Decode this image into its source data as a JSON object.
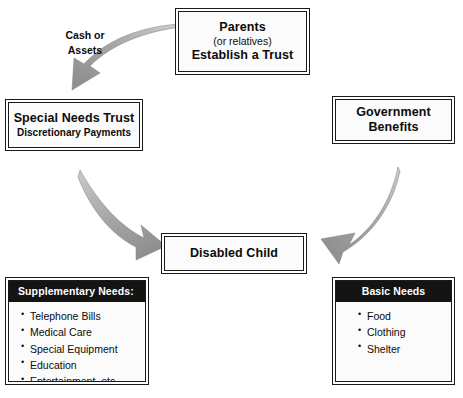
{
  "diagram": {
    "colors": {
      "box_border": "#1a1a1a",
      "box_fill": "#fbfbfb",
      "panel_header_bg": "#141414",
      "panel_header_text": "#ffffff",
      "arrow_light": "#c9c9c9",
      "arrow_dark": "#8f8f8f",
      "text": "#0c0c0c",
      "background": "#ffffff"
    },
    "nodes": {
      "parents": {
        "line1": "Parents",
        "line2": "(or relatives)",
        "line3": "Establish a Trust"
      },
      "special_needs_trust": {
        "line1": "Special Needs Trust",
        "line2": "Discretionary Payments"
      },
      "government_benefits": {
        "line1": "Government",
        "line2": "Benefits"
      },
      "disabled_child": {
        "line1": "Disabled Child"
      }
    },
    "panels": {
      "supplementary": {
        "header": "Supplementary Needs:",
        "items": [
          "Telephone Bills",
          "Medical Care",
          "Special Equipment",
          "Education",
          "Entertainment, etc."
        ]
      },
      "basic": {
        "header": "Basic Needs",
        "items": [
          "Food",
          "Clothing",
          "Shelter"
        ]
      }
    },
    "annotations": {
      "cash_or_assets": "Cash or\nAssets"
    },
    "arrows": {
      "parents_to_trust": "curved arrow from Parents box to Special Needs Trust box",
      "trust_to_child": "curved arrow from Special Needs Trust box to Disabled Child box",
      "benefits_to_child": "curved arrow from Government Benefits box to Disabled Child box"
    }
  }
}
